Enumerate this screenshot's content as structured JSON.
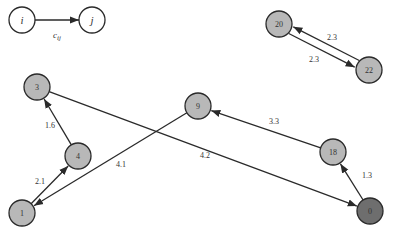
{
  "legend": {
    "from_node": "i",
    "to_node": "j",
    "edge_label": "c_ij",
    "edge_label_main": "c",
    "edge_label_sub": "ij"
  },
  "colors": {
    "node_fill": "#b8b8b8",
    "node_fill_dark": "#6e6e6e",
    "node_stroke": "#2a2a2a",
    "edge": "#2a2a2a",
    "text": "#333333",
    "background": "#ffffff"
  },
  "nodes": [
    {
      "id": "n20",
      "label": "20",
      "x": 279,
      "y": 24,
      "dark": false
    },
    {
      "id": "n22",
      "label": "22",
      "x": 369,
      "y": 70,
      "dark": false
    },
    {
      "id": "n3",
      "label": "3",
      "x": 37,
      "y": 87,
      "dark": false
    },
    {
      "id": "n4",
      "label": "4",
      "x": 78,
      "y": 156,
      "dark": false
    },
    {
      "id": "n1",
      "label": "1",
      "x": 22,
      "y": 213,
      "dark": false
    },
    {
      "id": "n9",
      "label": "9",
      "x": 198,
      "y": 106,
      "dark": false
    },
    {
      "id": "n18",
      "label": "18",
      "x": 333,
      "y": 152,
      "dark": false
    },
    {
      "id": "n0",
      "label": "0",
      "x": 370,
      "y": 211,
      "dark": true
    }
  ],
  "edges": [
    {
      "from": "n20",
      "to": "n22",
      "label": "2.3",
      "lx": 332,
      "ly": 40
    },
    {
      "from": "n22",
      "to": "n20",
      "label": "2.3",
      "lx": 314,
      "ly": 62
    },
    {
      "from": "n4",
      "to": "n3",
      "label": "1.6",
      "lx": 50,
      "ly": 128
    },
    {
      "from": "n1",
      "to": "n4",
      "label": "2.1",
      "lx": 40,
      "ly": 184
    },
    {
      "from": "n9",
      "to": "n1",
      "label": "4.1",
      "lx": 121,
      "ly": 167
    },
    {
      "from": "n3",
      "to": "n0",
      "label": "4.2",
      "lx": 205,
      "ly": 158
    },
    {
      "from": "n18",
      "to": "n9",
      "label": "3.3",
      "lx": 274,
      "ly": 124
    },
    {
      "from": "n0",
      "to": "n18",
      "label": "1.3",
      "lx": 367,
      "ly": 178
    }
  ]
}
